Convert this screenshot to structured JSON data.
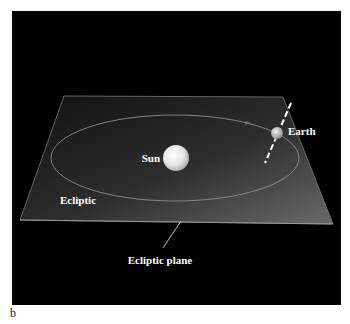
{
  "figure": {
    "panel_letter": "b",
    "background_color": "#000000",
    "plane_gradient": [
      "#141414",
      "#3a3a3a",
      "#6a6a6a"
    ],
    "labels": {
      "sun": "Sun",
      "earth": "Earth",
      "ecliptic": "Ecliptic",
      "ecliptic_plane": "Ecliptic plane"
    },
    "objects": {
      "sun": {
        "cx": 176,
        "cy": 158,
        "r": 13
      },
      "earth": {
        "cx": 277,
        "cy": 133,
        "r": 6
      },
      "orbit": {
        "cx": 175,
        "cy": 158,
        "rx": 124,
        "ry": 43
      },
      "earth_axis": {
        "x1": 291,
        "y1": 103,
        "x2": 265,
        "y2": 163
      }
    }
  }
}
